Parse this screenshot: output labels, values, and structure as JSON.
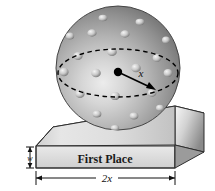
{
  "figure": {
    "background_color": "#ffffff",
    "width": 215,
    "height": 191
  },
  "sphere": {
    "name": "golf-ball",
    "center_dot_color": "#000000",
    "surface_light": "#e8e8e8",
    "surface_mid": "#a8a8a8",
    "surface_dark": "#5e5e5e",
    "outline_color": "#3a3a3a",
    "dimple_count": 20,
    "equator_style": "dashed",
    "equator_color": "#000000",
    "radius_label": "x",
    "radius_arrow": "center-to-equator"
  },
  "base": {
    "name": "trophy-base",
    "plate_text": "First Place",
    "top_face_light": "#f2f2f2",
    "top_face_dark": "#9a9a9a",
    "front_face_light": "#e4e4e4",
    "front_face_dark": "#b4b4b4",
    "side_face_light": "#ffffff",
    "side_face_dark": "#8d8d8d",
    "outline_color": "#2e2e2e"
  },
  "dimensions": {
    "width_label": "2x",
    "height_label": "w",
    "line_color": "#111111"
  },
  "labels": {
    "radius": "x",
    "base_width": "2x",
    "base_thickness": "w",
    "plate": "First Place"
  }
}
